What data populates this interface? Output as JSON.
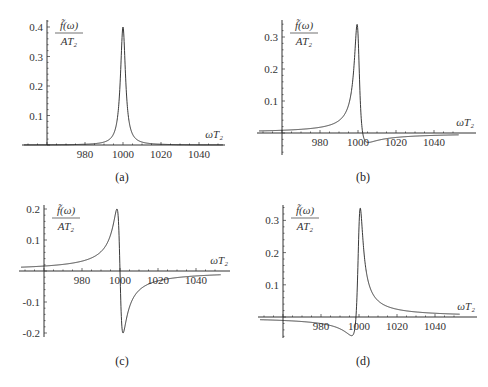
{
  "chart_data": [
    {
      "panel": "a",
      "type": "line",
      "caption": "(a)",
      "xlabel": "ωT₂",
      "ylabel_num": "f̃(ω)",
      "ylabel_den": "AT₂",
      "x_ticks": [
        980,
        1000,
        1020,
        1040
      ],
      "y_ticks": [
        0.1,
        0.2,
        0.3,
        0.4
      ],
      "y_tick_labels": [
        "0.1",
        "0.2",
        "0.3",
        "0.4"
      ],
      "xlim": [
        947,
        1053
      ],
      "ylim": [
        0,
        0.42
      ],
      "axis_origin_x": 960,
      "lorentz": {
        "center": 1000,
        "gamma": 1.6,
        "absorption": 0.4,
        "dispersion": 0.0
      },
      "x": [
        950,
        970,
        980,
        990,
        995,
        997,
        998,
        999,
        1000,
        1001,
        1002,
        1003,
        1005,
        1010,
        1020,
        1030,
        1050
      ],
      "values": [
        0.001,
        0.003,
        0.003,
        0.01,
        0.037,
        0.095,
        0.157,
        0.287,
        0.4,
        0.287,
        0.157,
        0.095,
        0.037,
        0.01,
        0.003,
        0.001,
        0.001
      ],
      "pixel": {
        "x0": 47,
        "y0": 145,
        "px_per_x": 1.9,
        "px_per_y": 295,
        "axis_left": 22,
        "axis_right": 225,
        "axis_top": 20,
        "axis_bottom": 145
      }
    },
    {
      "panel": "b",
      "type": "line",
      "caption": "(b)",
      "xlabel": "ωT₂",
      "ylabel_num": "f̃(ω)",
      "ylabel_den": "AT₂",
      "x_ticks": [
        980,
        1000,
        1020,
        1040
      ],
      "y_ticks": [
        0.1,
        0.2,
        0.3
      ],
      "y_tick_labels": [
        "0.1",
        "0.2",
        "0.3"
      ],
      "xlim": [
        947,
        1053
      ],
      "ylim": [
        -0.06,
        0.35
      ],
      "axis_origin_x": 960,
      "lorentz": {
        "center": 1000,
        "gamma": 1.6,
        "absorption": 0.31,
        "dispersion": 0.2
      },
      "x": [
        950,
        970,
        980,
        990,
        995,
        998,
        999,
        999.5,
        1000,
        1001,
        1002,
        1005,
        1010,
        1020,
        1040,
        1050
      ],
      "values": [
        0.01,
        0.017,
        0.024,
        0.05,
        0.1,
        0.22,
        0.33,
        0.34,
        0.31,
        0.05,
        -0.03,
        -0.025,
        -0.015,
        -0.008,
        -0.004,
        -0.003
      ],
      "pixel": {
        "x0": 282,
        "y0": 133,
        "px_per_x": 1.9,
        "px_per_y": 320,
        "axis_left": 257,
        "axis_right": 476,
        "axis_top": 20,
        "axis_bottom": 155
      }
    },
    {
      "panel": "c",
      "type": "line",
      "caption": "(c)",
      "xlabel": "ωT₂",
      "ylabel_num": "f̃(ω)",
      "ylabel_den": "AT₂",
      "x_ticks": [
        980,
        1000,
        1020,
        1040
      ],
      "y_ticks": [
        -0.2,
        -0.1,
        0.1,
        0.2
      ],
      "y_tick_labels": [
        "-0.2",
        "-0.1",
        "0.1",
        "0.2"
      ],
      "xlim": [
        947,
        1053
      ],
      "ylim": [
        -0.21,
        0.21
      ],
      "axis_origin_x": 960,
      "lorentz": {
        "center": 1000,
        "gamma": 1.6,
        "absorption": 0.0,
        "dispersion": 0.4
      },
      "x": [
        950,
        970,
        980,
        990,
        995,
        998,
        998.4,
        1000,
        1001.6,
        1002,
        1005,
        1010,
        1020,
        1040,
        1050
      ],
      "values": [
        0.013,
        0.021,
        0.032,
        0.062,
        0.116,
        0.19,
        0.2,
        0.0,
        -0.2,
        -0.19,
        -0.116,
        -0.062,
        -0.032,
        -0.016,
        -0.013
      ],
      "pixel": {
        "x0": 44,
        "y0": 271,
        "px_per_x": 1.9,
        "px_per_y": 310,
        "axis_left": 19,
        "axis_right": 230,
        "axis_top": 205,
        "axis_bottom": 337
      }
    },
    {
      "panel": "d",
      "type": "line",
      "caption": "(d)",
      "xlabel": "ωT₂",
      "ylabel_num": "f̃(ω)",
      "ylabel_den": "AT₂",
      "x_ticks": [
        980,
        1000,
        1020,
        1040
      ],
      "y_ticks": [
        0.1,
        0.2,
        0.3
      ],
      "y_tick_labels": [
        "0.1",
        "0.2",
        "0.3"
      ],
      "xlim": [
        947,
        1053
      ],
      "ylim": [
        -0.07,
        0.35
      ],
      "axis_origin_x": 960,
      "lorentz": {
        "center": 1000,
        "gamma": 1.6,
        "absorption": 0.28,
        "dispersion": -0.28
      },
      "x": [
        950,
        970,
        980,
        990,
        995,
        998,
        999,
        1000,
        1000.5,
        1001,
        1002,
        1005,
        1010,
        1020,
        1040,
        1050
      ],
      "values": [
        -0.008,
        -0.013,
        -0.02,
        -0.035,
        -0.05,
        -0.058,
        -0.03,
        0.28,
        0.34,
        0.32,
        0.2,
        0.09,
        0.047,
        0.022,
        0.01,
        0.008
      ],
      "pixel": {
        "x0": 283,
        "y0": 317,
        "px_per_x": 1.9,
        "px_per_y": 322,
        "axis_left": 258,
        "axis_right": 477,
        "axis_top": 205,
        "axis_bottom": 338
      }
    }
  ]
}
